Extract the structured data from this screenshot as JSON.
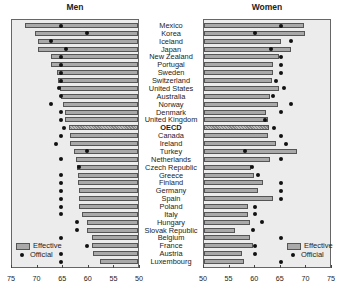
{
  "chart_data": {
    "type": "bar",
    "orientation": "horizontal",
    "layout": "population pyramid style, two mirrored panels",
    "categories": [
      "Mexico",
      "Korea",
      "Iceland",
      "Japan",
      "New Zealand",
      "Portugal",
      "Sweden",
      "Switzerland",
      "United States",
      "Australia",
      "Norway",
      "Denmark",
      "United Kingdom",
      "OECD",
      "Canada",
      "Ireland",
      "Turkey",
      "Netherlands",
      "Czech Republic",
      "Greece",
      "Finland",
      "Germany",
      "Spain",
      "Poland",
      "Italy",
      "Hungary",
      "Slovak Republic",
      "Belgium",
      "France",
      "Austria",
      "Luxembourg"
    ],
    "highlight_category": "OECD",
    "panels": [
      {
        "title": "Men",
        "xlim": [
          75,
          50
        ],
        "xticks": [
          75,
          70,
          65,
          60,
          55,
          50
        ],
        "series": [
          {
            "name": "Effective",
            "type": "bar",
            "values": [
              72.0,
              70.1,
              69.5,
              69.5,
              67.0,
              67.0,
              65.8,
              65.6,
              65.3,
              65.0,
              64.6,
              64.3,
              64.2,
              63.5,
              63.3,
              63.2,
              62.5,
              62.2,
              62.0,
              61.8,
              61.8,
              61.6,
              61.6,
              61.6,
              61.0,
              60.0,
              59.9,
              59.0,
              59.0,
              58.8,
              57.4
            ]
          },
          {
            "name": "Official",
            "type": "marker",
            "values": [
              65,
              60,
              67,
              64,
              65,
              65,
              65,
              65,
              65.5,
              65,
              67,
              65,
              65,
              64.5,
              65,
              66,
              60,
              65,
              61.5,
              65,
              65,
              65,
              65,
              65,
              65,
              62,
              62,
              65,
              60,
              65,
              65
            ]
          }
        ],
        "legend": {
          "position": "lower left",
          "entries": [
            "Effective",
            "Official"
          ]
        }
      },
      {
        "title": "Women",
        "xlim": [
          50,
          75
        ],
        "xticks": [
          50,
          55,
          60,
          65,
          70,
          75
        ],
        "series": [
          {
            "name": "Effective",
            "type": "bar",
            "values": [
              69.5,
              69.8,
              65.0,
              67.0,
              64.6,
              63.5,
              63.5,
              63.2,
              64.6,
              62.8,
              64.5,
              62.2,
              62.5,
              62.7,
              62.5,
              64.0,
              68.2,
              62.8,
              59.2,
              59.8,
              61.5,
              60.5,
              63.5,
              58.5,
              58.6,
              58.9,
              56.0,
              58.9,
              59.6,
              57.5,
              57.8
            ]
          },
          {
            "name": "Official",
            "type": "marker",
            "values": [
              65,
              60,
              67,
              63,
              65,
              65,
              65,
              64,
              65.7,
              63.5,
              67,
              65,
              62,
              63.6,
              65,
              66,
              58,
              65,
              59.4,
              60.5,
              65,
              65,
              65,
              60,
              60,
              61.4,
              59.5,
              65,
              60,
              60,
              65
            ]
          }
        ],
        "legend": {
          "position": "lower right",
          "entries": [
            "Effective",
            "Official"
          ]
        }
      }
    ],
    "xlabel": "",
    "ylabel": "",
    "grid": false
  },
  "panels": {
    "men_title": "Men",
    "women_title": "Women"
  },
  "legend": {
    "effective": "Effective",
    "official": "Official"
  },
  "axis": {
    "men_ticks": [
      "75",
      "70",
      "65",
      "60",
      "55",
      "50"
    ],
    "women_ticks": [
      "50",
      "55",
      "60",
      "65",
      "70",
      "75"
    ]
  }
}
